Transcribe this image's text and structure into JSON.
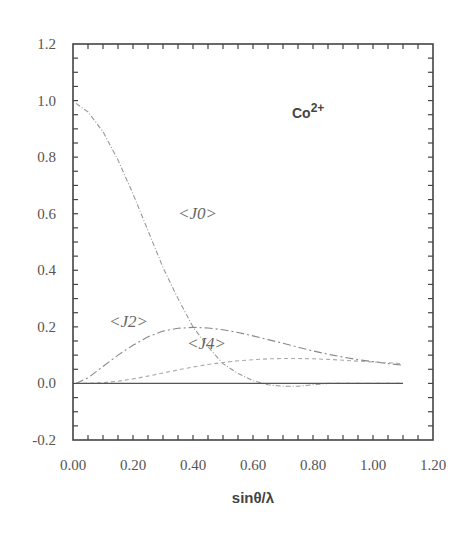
{
  "chart_data": {
    "type": "line",
    "title": "",
    "annotation": "Co2+",
    "xlabel": "sinθ/λ",
    "ylabel": "",
    "xlim": [
      0.0,
      1.2
    ],
    "ylim": [
      -0.2,
      1.2
    ],
    "x_ticks": [
      "0.00",
      "0.20",
      "0.40",
      "0.60",
      "0.80",
      "1.00",
      "1.20"
    ],
    "y_ticks": [
      "-0.2",
      "0.0",
      "0.2",
      "0.4",
      "0.6",
      "0.8",
      "1.0",
      "1.2"
    ],
    "grid": false,
    "legend": "inline labels",
    "x": [
      0.01,
      0.05,
      0.1,
      0.15,
      0.2,
      0.25,
      0.3,
      0.35,
      0.4,
      0.45,
      0.5,
      0.55,
      0.6,
      0.65,
      0.7,
      0.75,
      0.8,
      0.85,
      0.9,
      0.95,
      1.0,
      1.05,
      1.1
    ],
    "series": [
      {
        "name": "<J0>",
        "label_pos": [
          0.35,
          0.58
        ],
        "values": [
          0.99,
          0.96,
          0.89,
          0.79,
          0.67,
          0.54,
          0.41,
          0.3,
          0.2,
          0.13,
          0.07,
          0.035,
          0.01,
          -0.005,
          -0.01,
          -0.01,
          -0.005,
          0.0,
          0.0,
          0.0,
          0.0,
          0.0,
          0.0
        ]
      },
      {
        "name": "<J2>",
        "label_pos": [
          0.12,
          0.2
        ],
        "values": [
          0.0,
          0.02,
          0.06,
          0.1,
          0.135,
          0.165,
          0.185,
          0.195,
          0.198,
          0.196,
          0.19,
          0.18,
          0.168,
          0.155,
          0.142,
          0.128,
          0.115,
          0.103,
          0.093,
          0.084,
          0.077,
          0.07,
          0.064
        ]
      },
      {
        "name": "<J4>",
        "label_pos": [
          0.38,
          0.12
        ],
        "values": [
          0.0,
          0.0,
          0.003,
          0.008,
          0.016,
          0.026,
          0.037,
          0.048,
          0.058,
          0.067,
          0.074,
          0.08,
          0.084,
          0.087,
          0.088,
          0.088,
          0.087,
          0.085,
          0.082,
          0.079,
          0.076,
          0.073,
          0.07
        ]
      },
      {
        "name": "zero",
        "values": [
          0,
          0,
          0,
          0,
          0,
          0,
          0,
          0,
          0,
          0,
          0,
          0,
          0,
          0,
          0,
          0,
          0,
          0,
          0,
          0,
          0,
          0,
          0
        ]
      }
    ]
  }
}
